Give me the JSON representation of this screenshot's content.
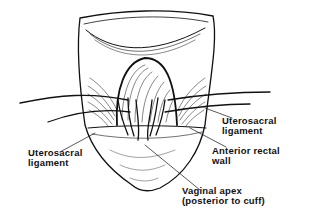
{
  "figure": {
    "labels": {
      "left_uterosacral": {
        "line1": "Uterosacral",
        "line2": "ligament"
      },
      "right_uterosacral": {
        "line1": "Uterosacral",
        "line2": "ligament"
      },
      "anterior_rectal_wall": {
        "line1": "Anterior  rectal",
        "line2": "wall"
      },
      "vaginal_apex": {
        "line1": "Vaginal  apex",
        "line2": "(posterior  to  cuff)"
      }
    },
    "colors": {
      "ink": "#111111",
      "background": "#ffffff"
    }
  }
}
